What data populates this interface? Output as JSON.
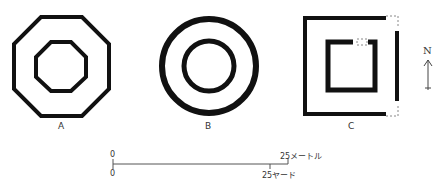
{
  "figures": [
    {
      "id": "A",
      "label": "A",
      "shape": "octagon"
    },
    {
      "id": "B",
      "label": "B",
      "shape": "circle"
    },
    {
      "id": "C",
      "label": "C",
      "shape": "square"
    }
  ],
  "north_arrow": {
    "label": "N"
  },
  "scale_bar": {
    "top_start": "0",
    "top_end": "25メートル",
    "bottom_start": "0",
    "bottom_end": "25ヤード"
  },
  "colors": {
    "stroke": "#111111",
    "dashed": "#888888",
    "background": "#ffffff"
  }
}
